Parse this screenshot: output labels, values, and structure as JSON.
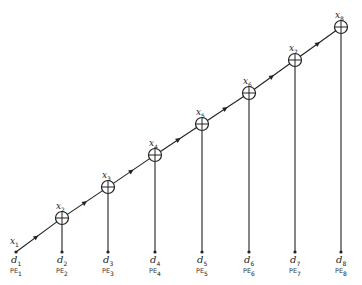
{
  "diagram": {
    "type": "linear systolic array / chain of processing elements",
    "stroke_color": "#222222",
    "start": {
      "x": 16,
      "y": 252,
      "label_x": "x",
      "label_x_sub": "1",
      "label_d": "d",
      "label_d_sub": "1",
      "label_pe": "PE",
      "label_pe_sub": "1"
    },
    "nodes": [
      {
        "id": 2,
        "cx": 62,
        "cy": 218,
        "label_x": "x",
        "label_x_sub": "2",
        "label_d": "d",
        "label_d_sub": "2",
        "label_pe": "PE",
        "label_pe_sub": "2"
      },
      {
        "id": 3,
        "cx": 108,
        "cy": 187,
        "label_x": "x",
        "label_x_sub": "3",
        "label_d": "d",
        "label_d_sub": "3",
        "label_pe": "PE",
        "label_pe_sub": "3"
      },
      {
        "id": 4,
        "cx": 155,
        "cy": 155,
        "label_x": "x",
        "label_x_sub": "4",
        "label_d": "d",
        "label_d_sub": "4",
        "label_pe": "PE",
        "label_pe_sub": "4"
      },
      {
        "id": 5,
        "cx": 202,
        "cy": 124,
        "label_x": "x",
        "label_x_sub": "5",
        "label_d": "d",
        "label_d_sub": "5",
        "label_pe": "PE",
        "label_pe_sub": "5"
      },
      {
        "id": 6,
        "cx": 249,
        "cy": 93,
        "label_x": "x",
        "label_x_sub": "6",
        "label_d": "d",
        "label_d_sub": "6",
        "label_pe": "PE",
        "label_pe_sub": "6"
      },
      {
        "id": 7,
        "cx": 295,
        "cy": 60,
        "label_x": "x",
        "label_x_sub": "7",
        "label_d": "d",
        "label_d_sub": "7",
        "label_pe": "PE",
        "label_pe_sub": "7"
      },
      {
        "id": 8,
        "cx": 341,
        "cy": 27,
        "label_x": "x",
        "label_x_sub": "8",
        "label_d": "d",
        "label_d_sub": "8",
        "label_pe": "PE",
        "label_pe_sub": "8"
      }
    ],
    "node_symbol": "circle-plus (adder)",
    "baseline_y": 252
  }
}
